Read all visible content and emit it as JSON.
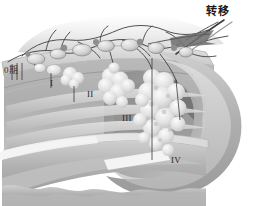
{
  "figure": {
    "kind": "medical-anatomical-illustration",
    "style": "grayscale-airbrush",
    "background_color": "#ffffff"
  },
  "labels": {
    "stage_0": "0期",
    "stage_1": "I",
    "stage_2": "II",
    "stage_3": "III",
    "stage_4": "IV",
    "metastasis": "转移"
  },
  "colors": {
    "outline": "#4a4a4a",
    "vessel": "#3a3a3a",
    "wall_light": "#d8d8d8",
    "wall_mid": "#b4b4b4",
    "wall_dark": "#8e8e8e",
    "lumen_shadow": "#767676",
    "tumor_light": "#ededed",
    "tumor_mid": "#cfcfcf",
    "serosa": "#c6c6c6",
    "text": "#1d1d1d"
  },
  "anatomy": {
    "parts": [
      "colon-wall-cross-section",
      "mucosa-layer",
      "submucosa-layer",
      "muscularis-layer",
      "serosa-layer",
      "lumen-cavity",
      "mesenteric-fat",
      "lymph-vessel-network",
      "lymph-nodes",
      "tumor-masses"
    ]
  }
}
